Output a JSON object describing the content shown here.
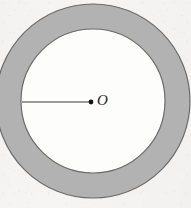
{
  "figure": {
    "name": "annulus-with-radius",
    "canvas": {
      "width": 191,
      "height": 208
    },
    "background_color": "#f6f5f3",
    "center_label": "O",
    "center_label_color": "#1d1d1d",
    "annulus": {
      "center_x": 93,
      "center_y": 101,
      "outer_radius": 97,
      "inner_radius": 72,
      "ring_fill_color": "#b2b2b2",
      "inner_fill_color": "#fdfdfc",
      "stroke_color": "#6b6b6b",
      "stroke_width": 1.2
    },
    "radius_line": {
      "x1": 22,
      "y1": 102,
      "x2": 91,
      "y2": 102,
      "stroke_color": "#3a3a3a",
      "stroke_width": 1.2
    },
    "center_dot": {
      "cx": 91,
      "cy": 102,
      "r": 2.4,
      "fill_color": "#151515"
    },
    "label_position": {
      "left": 97,
      "top": 93
    }
  }
}
